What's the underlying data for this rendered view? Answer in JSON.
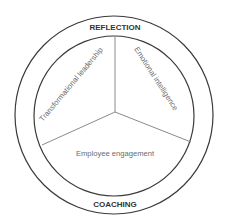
{
  "diagram": {
    "outer_ring": {
      "top_label": "REFLECTION",
      "bottom_label": "COACHING"
    },
    "segments": [
      {
        "label": "Transformational leadership",
        "position": "upper-left"
      },
      {
        "label": "Emotional intelligence",
        "position": "upper-right"
      },
      {
        "label": "Employee engagement",
        "position": "bottom"
      }
    ],
    "colors": {
      "ring_stroke": "#3a3a3a",
      "divider_stroke": "#8a8a8a",
      "ring_label": "#333333",
      "segment_label": "#6a6a6a",
      "background": "#ffffff"
    }
  }
}
